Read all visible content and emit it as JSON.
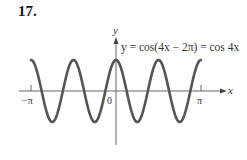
{
  "problem_number": "17.",
  "colors": {
    "curve": "#555555",
    "axes": "#666666",
    "text": "#333333",
    "background": "#ffffff"
  },
  "chart_data": {
    "type": "line",
    "title": "",
    "function_label": "y = cos(4x − 2π) = cos 4x",
    "xlabel": "x",
    "ylabel": "y",
    "x_ticks": [
      "−π",
      "0",
      "π"
    ],
    "xlim": [
      -3.14159,
      3.14159
    ],
    "ylim": [
      -1,
      1
    ],
    "grid": false,
    "legend": "none",
    "series": [
      {
        "name": "cos 4x",
        "x": [
          -3.1416,
          -2.7489,
          -2.3562,
          -1.9635,
          -1.5708,
          -1.1781,
          -0.7854,
          -0.3927,
          0,
          0.3927,
          0.7854,
          1.1781,
          1.5708,
          1.9635,
          2.3562,
          2.7489,
          3.1416
        ],
        "values": [
          1,
          0,
          -1,
          0,
          1,
          0,
          -1,
          0,
          1,
          0,
          -1,
          0,
          1,
          0,
          -1,
          0,
          1
        ]
      }
    ]
  },
  "labels": {
    "y_axis": "y",
    "x_axis": "x",
    "equation": "y = cos(4x − 2π) = cos 4x",
    "neg_pi": "−π",
    "zero": "0",
    "pi": "π"
  }
}
